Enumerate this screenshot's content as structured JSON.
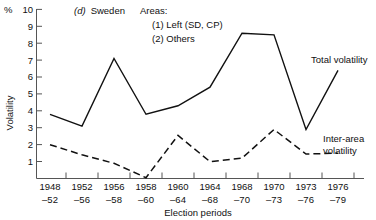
{
  "chart_data": {
    "type": "line",
    "title_prefix_italic": "(d)",
    "title_rest": "Sweden",
    "xlabel": "Election periods",
    "ylabel": "Volatility",
    "yunit": "%",
    "ylim": [
      0,
      10
    ],
    "yticks": [
      1,
      2,
      3,
      4,
      5,
      6,
      7,
      8,
      9,
      10
    ],
    "grid": false,
    "legend_position": "inline-annotations",
    "categories": [
      "1948–52",
      "1952–56",
      "1956–58",
      "1958–60",
      "1960–64",
      "1964–68",
      "1968–70",
      "1970–73",
      "1973–76",
      "1976–79"
    ],
    "categories_top": [
      "1948",
      "1952",
      "1956",
      "1958",
      "1960",
      "1964",
      "1968",
      "1970",
      "1973",
      "1976"
    ],
    "categories_bottom": [
      "–52",
      "–56",
      "–58",
      "–60",
      "–64",
      "–68",
      "–70",
      "–73",
      "–76",
      "–79"
    ],
    "series": [
      {
        "name": "Total volatility",
        "style": "solid",
        "values": [
          3.8,
          3.1,
          7.1,
          3.8,
          4.3,
          5.4,
          8.6,
          8.5,
          2.9,
          6.4
        ]
      },
      {
        "name": "Inter-area volatility",
        "style": "dashed",
        "values": [
          2.0,
          1.4,
          0.9,
          0.05,
          2.55,
          1.0,
          1.2,
          2.9,
          1.45,
          1.5
        ]
      }
    ],
    "annotations": [
      {
        "id": "areas-heading",
        "text": "Areas:"
      },
      {
        "id": "area-1",
        "text": "(1) Left (SD, CP)"
      },
      {
        "id": "area-2",
        "text": "(2) Others"
      },
      {
        "id": "label-total",
        "text": "Total volatility"
      },
      {
        "id": "label-inter-line1",
        "text": "Inter-area"
      },
      {
        "id": "label-inter-line2",
        "text": "volatility"
      }
    ],
    "colors": {
      "line": "#111111",
      "axis": "#555555",
      "background": "#ffffff"
    }
  }
}
